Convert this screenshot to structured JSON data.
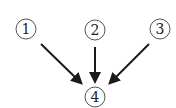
{
  "diagram": {
    "type": "directed-graph",
    "nodes": [
      {
        "id": "1",
        "label": "1",
        "cx": 26,
        "cy": 29,
        "r": 10
      },
      {
        "id": "2",
        "label": "2",
        "cx": 95,
        "cy": 30,
        "r": 10
      },
      {
        "id": "3",
        "label": "3",
        "cx": 160,
        "cy": 29,
        "r": 10
      },
      {
        "id": "4",
        "label": "4",
        "cx": 95,
        "cy": 97,
        "r": 10
      }
    ],
    "edges": [
      {
        "from": "1",
        "to": "4",
        "x1": 41,
        "y1": 44,
        "x2": 80,
        "y2": 82
      },
      {
        "from": "2",
        "to": "4",
        "x1": 95,
        "y1": 47,
        "x2": 95,
        "y2": 80
      },
      {
        "from": "3",
        "to": "4",
        "x1": 149,
        "y1": 44,
        "x2": 111,
        "y2": 82
      }
    ],
    "colors": {
      "stroke": "#1a1a1a",
      "circle": "#555555",
      "background": "#ffffff"
    }
  }
}
